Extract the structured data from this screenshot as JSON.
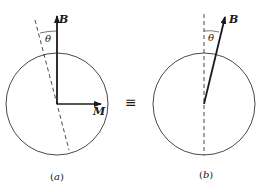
{
  "figure": {
    "colors": {
      "ink": "#1a1a1a",
      "background": "#ffffff"
    },
    "equivalence_symbol": "≡",
    "panels": [
      {
        "id": "a",
        "caption_open": "(",
        "caption_letter": "a",
        "caption_close": ")",
        "vectors": [
          {
            "label": "B",
            "direction": "vertical-up"
          },
          {
            "label": "M",
            "direction": "horizontal-right"
          }
        ],
        "angle_label": "θ",
        "axis": "dashed line tilted by θ from B"
      },
      {
        "id": "b",
        "caption_open": "(",
        "caption_letter": "b",
        "caption_close": ")",
        "vectors": [
          {
            "label": "B",
            "direction": "tilted by θ from vertical"
          }
        ],
        "angle_label": "θ",
        "axis": "dashed vertical line"
      }
    ]
  }
}
